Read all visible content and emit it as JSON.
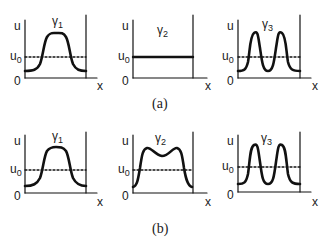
{
  "figure": {
    "rows": [
      {
        "caption": "(a)",
        "panels": [
          {
            "title": "γ",
            "title_sub": "1",
            "y_label": "u",
            "u0_label": "u",
            "u0_sub": "0",
            "origin_label": "0",
            "x_label": "x",
            "profile": "single-bump"
          },
          {
            "title": "γ",
            "title_sub": "2",
            "y_label": "u",
            "u0_label": "u",
            "u0_sub": "0",
            "origin_label": "0",
            "x_label": "x",
            "profile": "flat-at-u0"
          },
          {
            "title": "γ",
            "title_sub": "3",
            "y_label": "u",
            "u0_label": "u",
            "u0_sub": "0",
            "origin_label": "0",
            "x_label": "x",
            "profile": "double-bump"
          }
        ]
      },
      {
        "caption": "(b)",
        "panels": [
          {
            "title": "γ",
            "title_sub": "1",
            "y_label": "u",
            "u0_label": "u",
            "u0_sub": "0",
            "origin_label": "0",
            "x_label": "x",
            "profile": "single-bump"
          },
          {
            "title": "γ",
            "title_sub": "2",
            "y_label": "u",
            "u0_label": "u",
            "u0_sub": "0",
            "origin_label": "0",
            "x_label": "x",
            "profile": "wide-bump-with-dip"
          },
          {
            "title": "γ",
            "title_sub": "3",
            "y_label": "u",
            "u0_label": "u",
            "u0_sub": "0",
            "origin_label": "0",
            "x_label": "x",
            "profile": "double-bump"
          }
        ]
      }
    ],
    "colors": {
      "line": "#111111",
      "background": "#ffffff"
    }
  }
}
